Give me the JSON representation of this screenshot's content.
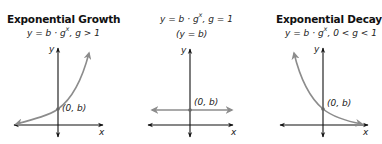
{
  "panels": [
    {
      "title": "Exponential Growth",
      "equation_main": "y = b · g",
      "equation_exp": "x",
      "equation_cond": ", g > 1",
      "point_label": "(0, b)",
      "x_axis_label": "x",
      "y_axis_label": "y"
    },
    {
      "title": "",
      "equation_main": "y = b · g",
      "equation_exp": "x",
      "equation_cond": ", g = 1",
      "subtitle": "(y = b)",
      "point_label": "(0, b)",
      "x_axis_label": "x",
      "y_axis_label": "y"
    },
    {
      "title": "Exponential Decay",
      "equation_main": "y = b · g",
      "equation_exp": "x",
      "equation_cond": ", 0 < g < 1",
      "point_label": "(0, b)",
      "x_axis_label": "x",
      "y_axis_label": "y"
    }
  ],
  "colors": {
    "axis": "#111111",
    "curve": "#8c8c8c",
    "point": "#666666",
    "text": "#222222"
  }
}
